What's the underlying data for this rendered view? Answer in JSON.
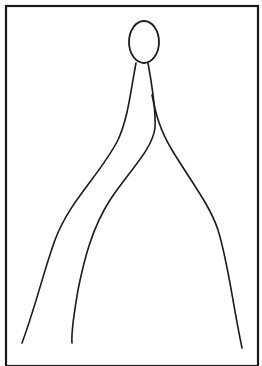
{
  "drawing": {
    "description": "Hand-drawn line sketch inside a rectangular frame: an oval head on top with curved lines flowing downward and outward",
    "stroke_color": "#1a1a1a",
    "background_color": "#ffffff",
    "frame": {
      "x": 6,
      "y": 6,
      "width": 252,
      "height": 360
    },
    "head": {
      "cx": 144,
      "cy": 42,
      "rx": 15,
      "ry": 21
    },
    "strokes": [
      {
        "name": "left-stroke",
        "d": "M 136 63 C 130 95, 128 118, 118 140 C 100 175, 70 200, 55 240 C 44 270, 36 305, 22 343"
      },
      {
        "name": "middle-stroke",
        "d": "M 148 63 C 152 85, 156 110, 155 128 C 152 150, 130 170, 110 200 C 92 228, 84 260, 78 290 C 74 315, 71 330, 72 343"
      },
      {
        "name": "right-stroke",
        "d": "M 152 95 C 156 115, 160 130, 172 150 C 190 180, 210 205, 218 230 C 228 262, 232 300, 242 348"
      }
    ]
  }
}
